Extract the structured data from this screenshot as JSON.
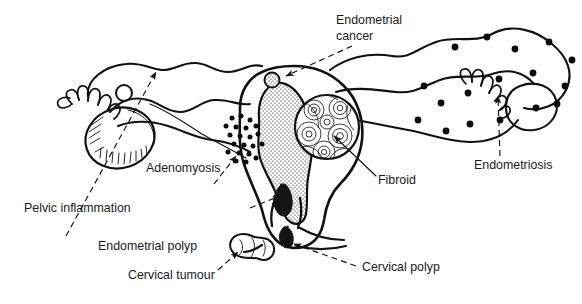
{
  "figure": {
    "background_color": "#ffffff",
    "ink_color": "#111111",
    "cavity_fill": "#b9b9b9",
    "label_color": "#1b1b1b"
  },
  "labels": [
    {
      "id": "endometrial-cancer",
      "line1": "Endometrial",
      "line2": "cancer",
      "x": 336,
      "y": 24,
      "anchor": "start",
      "target": "fundal nodule",
      "leader": "dashed",
      "arrow": true
    },
    {
      "id": "adenomyosis",
      "line1": "Adenomyosis",
      "line2": "",
      "x": 146,
      "y": 172,
      "anchor": "start",
      "target": "myometrial dot cluster",
      "leader": "dashed",
      "arrow": true
    },
    {
      "id": "fibroid",
      "line1": "Fibroid",
      "line2": "",
      "x": 378,
      "y": 184,
      "anchor": "start",
      "target": "whorled intramural mass",
      "leader": "solid",
      "arrow": true
    },
    {
      "id": "endometriosis",
      "line1": "Endometriosis",
      "line2": "",
      "x": 474,
      "y": 169,
      "anchor": "start",
      "target": "right adnexal deposits",
      "leader": "dashed",
      "arrow": true
    },
    {
      "id": "pelvic-inflammation",
      "line1": "Pelvic inflammation",
      "line2": "",
      "x": 24,
      "y": 212,
      "anchor": "start",
      "target": "left ovary and tube",
      "leader": "dashed",
      "arrow": true
    },
    {
      "id": "endometrial-polyp",
      "line1": "Endometrial polyp",
      "line2": "",
      "x": 98,
      "y": 250,
      "anchor": "start",
      "target": "polyp in lower cavity",
      "leader": "dashed",
      "arrow": true
    },
    {
      "id": "cervical-tumour",
      "line1": "Cervical tumour",
      "line2": "",
      "x": 128,
      "y": 279,
      "anchor": "start",
      "target": "lobulated cervical mass",
      "leader": "dashed",
      "arrow": true
    },
    {
      "id": "cervical-polyp",
      "line1": "Cervical polyp",
      "line2": "",
      "x": 362,
      "y": 271,
      "anchor": "start",
      "target": "polyp at external os",
      "leader": "dashed",
      "arrow": true
    }
  ],
  "structures": [
    {
      "id": "uterus-body",
      "name": "uterine body"
    },
    {
      "id": "uterine-cavity",
      "name": "endometrial cavity"
    },
    {
      "id": "cervix",
      "name": "cervix"
    },
    {
      "id": "left-broad-ligament",
      "name": "left broad ligament"
    },
    {
      "id": "right-broad-ligament",
      "name": "right broad ligament"
    },
    {
      "id": "left-tube",
      "name": "left fallopian tube"
    },
    {
      "id": "right-tube",
      "name": "right fallopian tube"
    },
    {
      "id": "left-fimbriae",
      "name": "left fimbriae"
    },
    {
      "id": "right-fimbriae",
      "name": "right fimbriae"
    },
    {
      "id": "left-ovary",
      "name": "left ovary"
    },
    {
      "id": "right-ovary",
      "name": "right ovary"
    },
    {
      "id": "vagina",
      "name": "vaginal canal"
    }
  ],
  "lesions": [
    {
      "id": "cancer-nodule",
      "name": "endometrial cancer nodule",
      "cx": 272,
      "cy": 80,
      "r": 7
    },
    {
      "id": "fibroid-mass",
      "name": "fibroid",
      "cx": 327,
      "cy": 127,
      "r": 33
    },
    {
      "id": "polyp-endometrial",
      "name": "endometrial polyp"
    },
    {
      "id": "tumour-cervical",
      "name": "cervical tumour"
    },
    {
      "id": "polyp-cervical",
      "name": "cervical polyp"
    }
  ],
  "adenomyosis_dots": [
    [
      232,
      118
    ],
    [
      241,
      116
    ],
    [
      250,
      120
    ],
    [
      226,
      126
    ],
    [
      236,
      127
    ],
    [
      246,
      128
    ],
    [
      256,
      126
    ],
    [
      230,
      135
    ],
    [
      240,
      136
    ],
    [
      250,
      137
    ],
    [
      258,
      134
    ],
    [
      234,
      144
    ],
    [
      244,
      145
    ],
    [
      253,
      146
    ],
    [
      228,
      152
    ],
    [
      239,
      153
    ],
    [
      249,
      154
    ],
    [
      236,
      161
    ],
    [
      246,
      162
    ],
    [
      256,
      158
    ],
    [
      262,
      144
    ]
  ],
  "endometriosis_dots": [
    [
      455,
      47
    ],
    [
      487,
      37
    ],
    [
      515,
      49
    ],
    [
      549,
      42
    ],
    [
      572,
      60
    ],
    [
      565,
      86
    ],
    [
      533,
      73
    ],
    [
      499,
      79
    ],
    [
      468,
      93
    ],
    [
      441,
      103
    ],
    [
      424,
      86
    ],
    [
      536,
      108
    ],
    [
      500,
      120
    ],
    [
      470,
      124
    ],
    [
      446,
      131
    ],
    [
      418,
      120
    ],
    [
      557,
      104
    ]
  ]
}
